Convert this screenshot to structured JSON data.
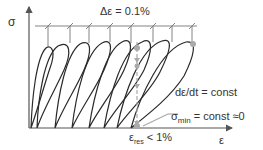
{
  "diagram": {
    "axes": {
      "y_label": "σ",
      "x_label": "ε"
    },
    "annotations": {
      "strain_increment_prefix": "Δε = ",
      "strain_increment_value": "0.1%",
      "strain_rate": "dε/dt = const",
      "sigma_min_symbol": "σ",
      "sigma_min_sub": "min",
      "sigma_min_rest": " = const ≈0",
      "eps_res_symbol": "ε",
      "eps_res_sub": "res",
      "eps_res_rest": " < 1%"
    },
    "colors": {
      "curve": "#2a2a2a",
      "axis": "#555555",
      "highlight": "#aaaaaa"
    },
    "loop_count": 8
  }
}
